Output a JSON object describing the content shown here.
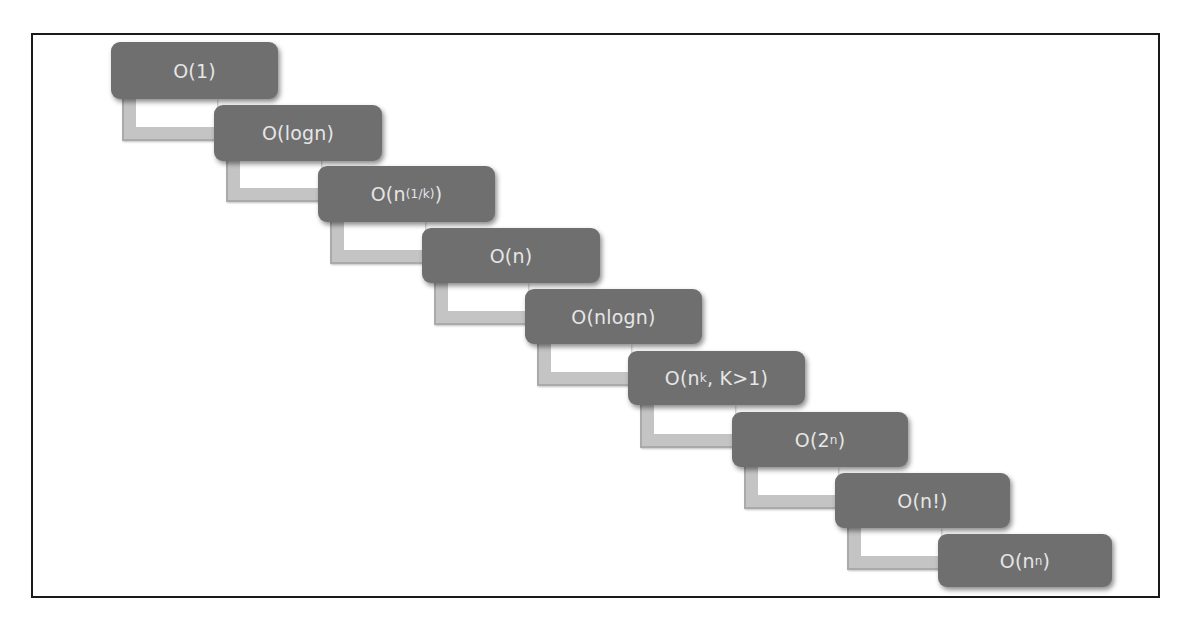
{
  "diagram": {
    "colors": {
      "box": "#6f6f6f",
      "text": "#e6e6e6",
      "connector": "#c4c4c4",
      "frame": "#1a1a1a"
    },
    "nodes": [
      {
        "base": "O(1",
        "sup": "",
        "tail": ")"
      },
      {
        "base": "O(logn",
        "sup": "",
        "tail": ")"
      },
      {
        "base": "O(n",
        "sup": "(1/k)",
        "tail": ")"
      },
      {
        "base": "O(n",
        "sup": "",
        "tail": ")"
      },
      {
        "base": "O(nlogn",
        "sup": "",
        "tail": ")"
      },
      {
        "base": "O(n",
        "sup": "k",
        "tail": ", K>1)"
      },
      {
        "base": "O(2",
        "sup": "n",
        "tail": ")"
      },
      {
        "base": "O(n!",
        "sup": "",
        "tail": ")"
      },
      {
        "base": "O(n",
        "sup": "n",
        "tail": ")"
      }
    ]
  }
}
